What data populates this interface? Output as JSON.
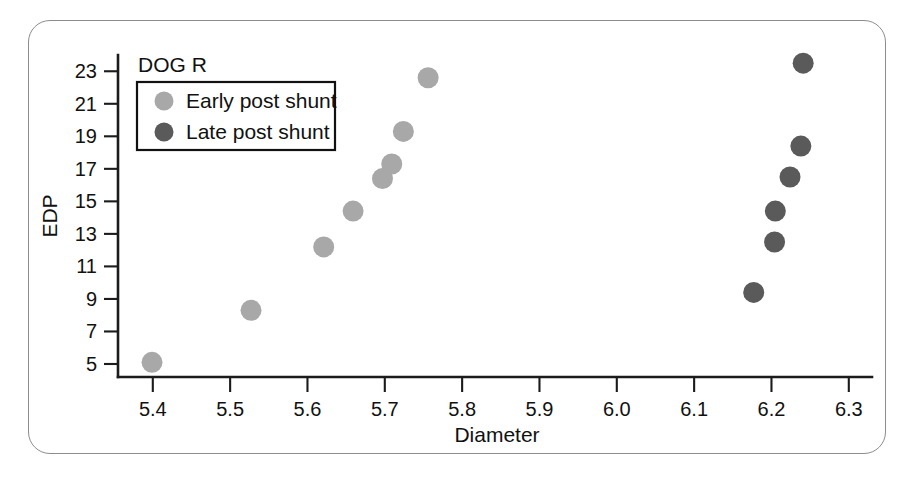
{
  "figure": {
    "panel_label": "DOG R",
    "border_color": "#8d8d8d",
    "background": "#ffffff"
  },
  "legend": {
    "position": "top-left",
    "entries": [
      {
        "label": "Early post shunt",
        "color": "#a8a8a8",
        "marker": "circle"
      },
      {
        "label": "Late post shunt",
        "color": "#5a5a5a",
        "marker": "circle"
      }
    ]
  },
  "axes": {
    "x_title": "Diameter",
    "y_title": "EDP",
    "x_ticks": [
      "5.4",
      "5.5",
      "5.6",
      "5.7",
      "5.8",
      "5.9",
      "6.0",
      "6.1",
      "6.2",
      "6.3"
    ],
    "y_ticks": [
      "5",
      "7",
      "9",
      "11",
      "13",
      "15",
      "17",
      "19",
      "21",
      "23"
    ]
  },
  "chart_data": {
    "type": "scatter",
    "title": "DOG R",
    "xlabel": "Diameter",
    "ylabel": "EDP",
    "xlim": [
      5.355,
      6.33
    ],
    "ylim": [
      4.2,
      24.0
    ],
    "xticks": [
      5.4,
      5.5,
      5.6,
      5.7,
      5.8,
      5.9,
      6.0,
      6.1,
      6.2,
      6.3
    ],
    "yticks": [
      5,
      7,
      9,
      11,
      13,
      15,
      17,
      19,
      21,
      23
    ],
    "grid": false,
    "legend_position": "top-left",
    "series": [
      {
        "name": "Early post shunt",
        "color": "#a8a8a8",
        "marker": "circle",
        "points": [
          {
            "x": 5.399,
            "y": 5.1
          },
          {
            "x": 5.527,
            "y": 8.3
          },
          {
            "x": 5.621,
            "y": 12.2
          },
          {
            "x": 5.659,
            "y": 14.4
          },
          {
            "x": 5.697,
            "y": 16.4
          },
          {
            "x": 5.709,
            "y": 17.3
          },
          {
            "x": 5.724,
            "y": 19.3
          },
          {
            "x": 5.756,
            "y": 22.6
          }
        ]
      },
      {
        "name": "Late post shunt",
        "color": "#5a5a5a",
        "marker": "circle",
        "points": [
          {
            "x": 6.177,
            "y": 9.4
          },
          {
            "x": 6.204,
            "y": 12.5
          },
          {
            "x": 6.205,
            "y": 14.4
          },
          {
            "x": 6.224,
            "y": 16.5
          },
          {
            "x": 6.238,
            "y": 18.4
          },
          {
            "x": 6.241,
            "y": 23.5
          }
        ]
      }
    ]
  }
}
